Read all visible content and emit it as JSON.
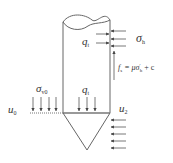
{
  "diagram": {
    "colors": {
      "line": "#555555",
      "text": "#333333",
      "background": "#ffffff"
    },
    "labels": {
      "q_top": {
        "main": "q",
        "sub": "t"
      },
      "sigma_h": {
        "main": "σ",
        "sub": "h"
      },
      "fs_formula": {
        "lhs_main": "f",
        "lhs_sub": "s",
        "rhs": " = μσ",
        "rhs_sup": "′",
        "rhs_sub": "h",
        "tail": " + c"
      },
      "sigma_v0": {
        "main": "σ",
        "sub": "v0"
      },
      "q_bottom": {
        "main": "q",
        "sub": "t"
      },
      "u0": {
        "main": "u",
        "sub": "0"
      },
      "u2": {
        "main": "u",
        "sub": "2"
      }
    },
    "elements": {
      "shaft": "cylindrical shaft with wavy cut top",
      "cone": "inverted triangular cone tip",
      "ground_line": "horizontal ground surface at left",
      "arrows": {
        "sigma_v0_down": 4,
        "q_t_bottom_down": 3,
        "q_t_side_right": 2,
        "sigma_h_left": 3,
        "fs_up": 1,
        "u2_left": 5
      }
    }
  }
}
